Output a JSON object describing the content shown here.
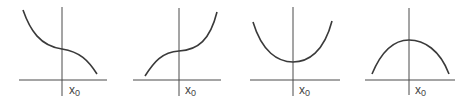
{
  "figure": {
    "panels": [
      {
        "id": "decreasing-inflection",
        "label": "x",
        "subscript": "0",
        "shape": "decreasing cubic with horizontal inflection at x0"
      },
      {
        "id": "increasing-inflection",
        "label": "x",
        "subscript": "0",
        "shape": "increasing cubic with horizontal inflection at x0"
      },
      {
        "id": "local-minimum",
        "label": "x",
        "subscript": "0",
        "shape": "upward parabola with minimum at x0"
      },
      {
        "id": "local-maximum",
        "label": "x",
        "subscript": "0",
        "shape": "downward parabola with maximum at x0"
      }
    ]
  },
  "colors": {
    "axis": "#4a4a4a",
    "curve": "#3a3a3a",
    "label": "#444444"
  }
}
